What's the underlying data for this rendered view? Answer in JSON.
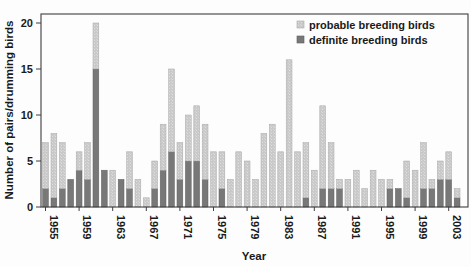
{
  "legend": {
    "probable_label": "probable breeding birds",
    "definite_label": "definite breeding birds"
  },
  "axes": {
    "y_title": "Number of pairs/drumming birds",
    "x_title": "Year",
    "y_ticks": [
      0,
      5,
      10,
      15,
      20
    ],
    "x_tick_years": [
      1955,
      1959,
      1963,
      1967,
      1971,
      1975,
      1979,
      1983,
      1987,
      1991,
      1995,
      1999,
      2003
    ]
  },
  "colors": {
    "probable_fill": "#c9c9c9",
    "probable_texture": "#dedede",
    "probable_edge": "#a8a8a8",
    "definite_fill": "#787878",
    "definite_edge": "#5f5f5f",
    "axis_line": "#3f3f3f",
    "text": "#1a1a1a",
    "background": "#fdfdfd"
  },
  "chart_data": {
    "type": "bar",
    "stacked": true,
    "title": "",
    "xlabel": "Year",
    "ylabel": "Number of pairs/drumming birds",
    "ylim": [
      0,
      21
    ],
    "grid": false,
    "legend_position": "top-right",
    "x": [
      1955,
      1956,
      1957,
      1958,
      1959,
      1960,
      1961,
      1962,
      1963,
      1964,
      1965,
      1966,
      1967,
      1968,
      1969,
      1970,
      1971,
      1972,
      1973,
      1974,
      1975,
      1976,
      1977,
      1978,
      1979,
      1980,
      1981,
      1982,
      1983,
      1984,
      1985,
      1986,
      1987,
      1988,
      1989,
      1990,
      1991,
      1992,
      1993,
      1994,
      1995,
      1996,
      1997,
      1998,
      1999,
      2000,
      2001,
      2002,
      2003,
      2004
    ],
    "series": [
      {
        "name": "definite breeding birds",
        "values": [
          2,
          1,
          2,
          3,
          4,
          3,
          15,
          4,
          0,
          3,
          2,
          0,
          0,
          2,
          4,
          6,
          3,
          5,
          5,
          3,
          0,
          2,
          0,
          0,
          0,
          0,
          0,
          0,
          0,
          0,
          0,
          1,
          0,
          2,
          2,
          2,
          0,
          0,
          0,
          0,
          0,
          2,
          2,
          1,
          0,
          2,
          2,
          3,
          3,
          1
        ]
      },
      {
        "name": "probable breeding birds",
        "values": [
          5,
          7,
          5,
          0,
          2,
          4,
          5,
          0,
          4,
          0,
          4,
          3,
          1,
          3,
          5,
          9,
          4,
          5,
          6,
          6,
          6,
          4,
          3,
          6,
          5,
          3,
          8,
          9,
          6,
          16,
          6,
          6,
          4,
          9,
          5,
          1,
          3,
          4,
          2,
          4,
          3,
          1,
          0,
          4,
          4,
          5,
          1,
          2,
          3,
          1
        ]
      }
    ],
    "totals": [
      7,
      8,
      7,
      3,
      6,
      7,
      20,
      4,
      4,
      3,
      6,
      3,
      1,
      5,
      9,
      15,
      7,
      10,
      11,
      9,
      6,
      6,
      3,
      6,
      5,
      3,
      8,
      9,
      6,
      16,
      6,
      7,
      4,
      11,
      7,
      3,
      3,
      4,
      2,
      4,
      3,
      3,
      2,
      5,
      4,
      7,
      3,
      5,
      6,
      2
    ]
  }
}
